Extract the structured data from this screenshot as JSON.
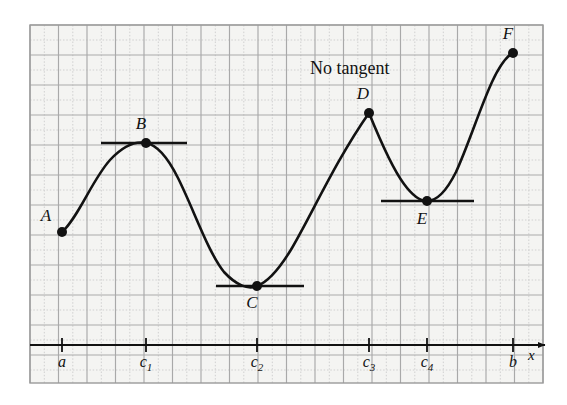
{
  "figure": {
    "title": "",
    "annotation": "No tangent",
    "axis_label_x": "x"
  },
  "chart_data": {
    "type": "line",
    "title": "",
    "xlabel": "x",
    "ylabel": "",
    "grid": true,
    "legend_position": "none",
    "xlim": [
      0,
      18
    ],
    "ylim": [
      0,
      12
    ],
    "annotations": [
      {
        "text": "No tangent",
        "x_px": 310,
        "y_px": 74,
        "target_point": "D"
      }
    ],
    "x_tick_labels": [
      "a",
      "c1",
      "c2",
      "c3",
      "c4",
      "b"
    ],
    "x_tick_display": [
      "a",
      "c₁",
      "c₂",
      "c₃",
      "c₄",
      "b"
    ],
    "x_tick_px": [
      62,
      146,
      257,
      369,
      427,
      513
    ],
    "points": [
      {
        "label": "A",
        "x_px": 62,
        "y_px": 232,
        "kind": "endpoint",
        "tangent": false,
        "label_dx": -16,
        "label_dy": -11
      },
      {
        "label": "B",
        "x_px": 146,
        "y_px": 143,
        "kind": "local-maximum",
        "tangent": true,
        "tangent_x1": 101,
        "tangent_x2": 187,
        "label_dx": -5,
        "label_dy": -14
      },
      {
        "label": "C",
        "x_px": 257,
        "y_px": 286,
        "kind": "local-minimum",
        "tangent": true,
        "tangent_x1": 216,
        "tangent_x2": 304,
        "label_dx": -5,
        "label_dy": 22
      },
      {
        "label": "D",
        "x_px": 369,
        "y_px": 113,
        "kind": "corner-no-tangent",
        "tangent": false,
        "label_dx": -6,
        "label_dy": -14
      },
      {
        "label": "E",
        "x_px": 427,
        "y_px": 201,
        "kind": "local-minimum",
        "tangent": true,
        "tangent_x1": 381,
        "tangent_x2": 474,
        "label_dx": -5,
        "label_dy": 23
      },
      {
        "label": "F",
        "x_px": 513,
        "y_px": 53,
        "kind": "endpoint",
        "tangent": false,
        "label_dx": -5,
        "label_dy": -14
      }
    ],
    "curve_description": "Continuous curve from endpoint A rising to local max B, falling to local min C, rising steeply to a sharp corner at D where no tangent exists, falling to local min E, then rising in an S-shape to endpoint F.",
    "curve_path": "M 62 232 C 78 218, 92 180, 110 160 C 124 145, 136 141, 146 143 C 158 145, 168 158, 178 178 C 194 210, 208 252, 224 272 C 236 285, 248 290, 257 286 C 268 282, 280 268, 292 248 C 312 214, 336 160, 369 113 C 380 140, 392 168, 404 184 C 412 195, 420 201, 427 201 C 437 201, 446 192, 456 172 C 468 146, 480 108, 492 82 C 500 65, 507 56, 513 53"
  },
  "grid": {
    "bg_color": "#f4f4f2",
    "major_color": "#a9a9a9",
    "minor_color": "#d0d0d0",
    "border_color": "#9a9a9a",
    "curve_color": "#121212",
    "axis_color": "#111111",
    "plot_left": 30,
    "plot_top": 25,
    "plot_right": 543,
    "plot_bottom": 383,
    "major_step_x": 28.5,
    "major_step_y": 30,
    "axis_y": 345,
    "axis_x_end": 545
  }
}
